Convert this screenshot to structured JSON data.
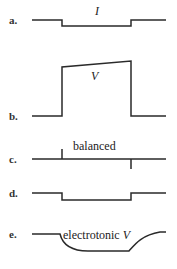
{
  "panels": [
    {
      "label": "a.",
      "annotation": "I",
      "kind": "current step"
    },
    {
      "label": "b.",
      "annotation": "V",
      "kind": "voltage response"
    },
    {
      "label": "c.",
      "annotation": "balanced",
      "kind": "balanced bridge transients"
    },
    {
      "label": "d.",
      "annotation": "",
      "kind": "step"
    },
    {
      "label": "e.",
      "annotation": "electrotonic V",
      "kind": "electrotonic potential"
    }
  ],
  "colors": {
    "stroke": "#2a2a2a",
    "background": "#ffffff"
  }
}
